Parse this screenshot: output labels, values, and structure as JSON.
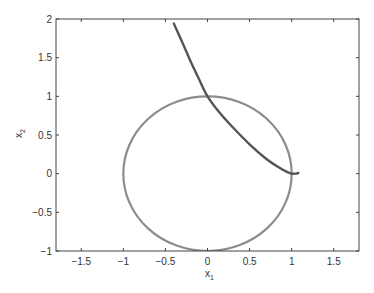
{
  "chart_data": {
    "type": "line",
    "title": "",
    "xlabel": "x",
    "xlabel_subscript": "1",
    "ylabel": "x",
    "ylabel_subscript": "2",
    "xlim": [
      -1.8,
      1.8
    ],
    "ylim": [
      -1,
      2
    ],
    "xticks": [
      -1.5,
      -1,
      -0.5,
      0,
      0.5,
      1,
      1.5
    ],
    "xtick_labels": [
      "-1.5",
      "-1",
      "-0.5",
      "0",
      "0.5",
      "1",
      "1.5"
    ],
    "yticks": [
      -1,
      -0.5,
      0,
      0.5,
      1,
      1.5,
      2
    ],
    "ytick_labels": [
      "-1",
      "-0.5",
      "0",
      "0.5",
      "1",
      "1.5",
      "2"
    ],
    "grid": false,
    "legend": null,
    "series": [
      {
        "name": "unit circle",
        "kind": "circle",
        "center": [
          0,
          0
        ],
        "radius": 1,
        "color": "#8c8c8c"
      },
      {
        "name": "trajectory",
        "kind": "curve",
        "color": "#555555",
        "x": [
          -0.4,
          -0.3,
          -0.2,
          -0.1,
          0.0,
          0.15,
          0.3,
          0.5,
          0.7,
          0.85,
          0.95,
          1.0,
          1.05,
          1.08
        ],
        "y": [
          1.94,
          1.7,
          1.45,
          1.22,
          1.0,
          0.78,
          0.6,
          0.38,
          0.19,
          0.08,
          0.02,
          0.0,
          0.0,
          0.01
        ]
      }
    ]
  },
  "colors": {
    "axes": "#444444",
    "circle": "#8c8c8c",
    "trajectory": "#555555",
    "text": "#333333"
  }
}
